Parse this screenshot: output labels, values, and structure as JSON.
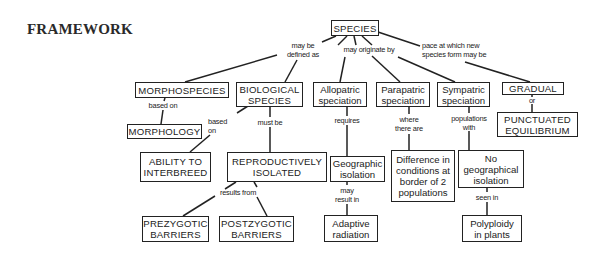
{
  "page": {
    "title": "FRAMEWORK"
  },
  "nodes": {
    "species": "SPECIES",
    "morphospecies": "MORPHOSPECIES",
    "biological_species": "BIOLOGICAL\nSPECIES",
    "allopatric": "Allopatric\nspeciation",
    "parapatric": "Parapatric\nspeciation",
    "sympatric": "Sympatric\nspeciation",
    "gradual": "GRADUAL",
    "punctuated": "PUNCTUATED\nEQUILIBRIUM",
    "morphology": "MORPHOLOGY",
    "ability": "ABILITY TO\nINTERBREED",
    "repro_isolated": "REPRODUCTIVELY\nISOLATED",
    "geographic_isolation": "Geographic\nisolation",
    "difference": "Difference in\nconditions at\nborder of 2\npopulations",
    "no_geo_isolation": "No\ngeographical\nisolation",
    "prezygotic": "PREZYGOTIC\nBARRIERS",
    "postzygotic": "POSTZYGOTIC\nBARRIERS",
    "adaptive_radiation": "Adaptive\nradiation",
    "polyploidy": "Polyploidy\nin plants"
  },
  "links": {
    "may_be_defined_as": "may be\ndefined as",
    "may_originate_by": "may originate by",
    "pace": "pace at which new\nspecies form may be",
    "morpho_based_on": "based on",
    "bio_based_on": "based\non",
    "must_be": "must be",
    "requires": "requires",
    "where_there_are": "where\nthere are",
    "populations_with": "populations\nwith",
    "or": "or",
    "results_from": "results from",
    "may_result_in": "may\nresult in",
    "seen_in": "seen in"
  }
}
